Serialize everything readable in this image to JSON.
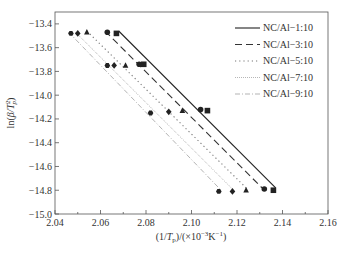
{
  "chart_data": {
    "type": "scatter",
    "title": "",
    "xlabel": "(1/Tp)/(×10⁻³K⁻¹)",
    "ylabel": "ln(β/Tp²)",
    "xlim": [
      2.04,
      2.16
    ],
    "ylim": [
      -15.0,
      -13.3
    ],
    "xticks": [
      2.04,
      2.06,
      2.08,
      2.1,
      2.12,
      2.14,
      2.16
    ],
    "xtick_labels": [
      "2.04",
      "2.06",
      "2.08",
      "2.10",
      "2.12",
      "2.14",
      "2.16"
    ],
    "yticks": [
      -13.4,
      -13.6,
      -13.8,
      -14.0,
      -14.2,
      -14.4,
      -14.6,
      -14.8,
      -15.0
    ],
    "ytick_labels": [
      "−13.4",
      "−13.6",
      "−13.8",
      "−14.0",
      "−14.2",
      "−14.4",
      "−14.6",
      "−14.8",
      "−15.0"
    ],
    "grid": false,
    "legend_position": "upper right",
    "series": [
      {
        "name": "NC/Al−1:10",
        "marker": "square",
        "line_style": "solid",
        "x": [
          2.067,
          2.079,
          2.107,
          2.136
        ],
        "y": [
          -13.48,
          -13.74,
          -14.13,
          -14.8
        ],
        "fit_line": {
          "x": [
            2.068,
            2.137
          ],
          "y": [
            -13.46,
            -14.78
          ]
        }
      },
      {
        "name": "NC/Al−3:10",
        "marker": "circle",
        "line_style": "dashed",
        "x": [
          2.063,
          2.077,
          2.104,
          2.132
        ],
        "y": [
          -13.47,
          -13.74,
          -14.12,
          -14.79
        ],
        "fit_line": {
          "x": [
            2.062,
            2.131
          ],
          "y": [
            -13.46,
            -14.78
          ]
        }
      },
      {
        "name": "NC/Al−5:10",
        "marker": "triangle",
        "line_style": "dotted",
        "x": [
          2.054,
          2.071,
          2.096,
          2.124
        ],
        "y": [
          -13.47,
          -13.75,
          -14.13,
          -14.8
        ],
        "fit_line": {
          "x": [
            2.054,
            2.124
          ],
          "y": [
            -13.46,
            -14.78
          ]
        }
      },
      {
        "name": "NC/Al−7:10",
        "marker": "diamond",
        "line_style": "dense-dotted",
        "x": [
          2.05,
          2.066,
          2.09,
          2.118
        ],
        "y": [
          -13.48,
          -13.75,
          -14.14,
          -14.81
        ],
        "fit_line": {
          "x": [
            2.049,
            2.118
          ],
          "y": [
            -13.47,
            -14.79
          ]
        }
      },
      {
        "name": "NC/Al−9:10",
        "marker": "hexagon",
        "line_style": "dash-dot",
        "x": [
          2.047,
          2.063,
          2.082,
          2.112
        ],
        "y": [
          -13.48,
          -13.75,
          -14.15,
          -14.81
        ],
        "fit_line": {
          "x": [
            2.046,
            2.113
          ],
          "y": [
            -13.47,
            -14.8
          ]
        }
      }
    ]
  },
  "legend": {
    "items": [
      {
        "label": "NC/Al−1:10"
      },
      {
        "label": "NC/Al−3:10"
      },
      {
        "label": "NC/Al−5:10"
      },
      {
        "label": "NC/Al−7:10"
      },
      {
        "label": "NC/Al−9:10"
      }
    ]
  }
}
